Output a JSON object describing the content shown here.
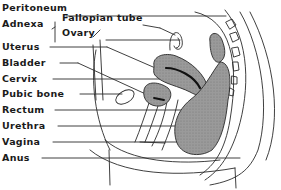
{
  "diagram": {
    "type": "anatomical-cross-section",
    "labels": [
      {
        "id": "peritoneum",
        "text": "Peritoneum",
        "x": 10,
        "y": 8
      },
      {
        "id": "adnexa",
        "text": "Adnexa",
        "x": 10,
        "y": 24
      },
      {
        "id": "fallopian-tube",
        "text": "Fallopian tube",
        "x": 62,
        "y": 17
      },
      {
        "id": "ovary",
        "text": "Ovary",
        "x": 62,
        "y": 32
      },
      {
        "id": "uterus",
        "text": "Uterus",
        "x": 10,
        "y": 41
      },
      {
        "id": "bladder",
        "text": "Bladder",
        "x": 10,
        "y": 57
      },
      {
        "id": "cervix",
        "text": "Cervix",
        "x": 10,
        "y": 73
      },
      {
        "id": "pubic-bone",
        "text": "Pubic bone",
        "x": 10,
        "y": 89
      },
      {
        "id": "rectum",
        "text": "Rectum",
        "x": 10,
        "y": 105
      },
      {
        "id": "urethra",
        "text": "Urethra",
        "x": 10,
        "y": 121
      },
      {
        "id": "vagina",
        "text": "Vagina",
        "x": 10,
        "y": 137
      },
      {
        "id": "anus",
        "text": "Anus",
        "x": 10,
        "y": 153
      }
    ],
    "colors": {
      "organ_fill": "#8f8f8f",
      "outline": "#2a2a2a",
      "background": "#ffffff"
    }
  }
}
